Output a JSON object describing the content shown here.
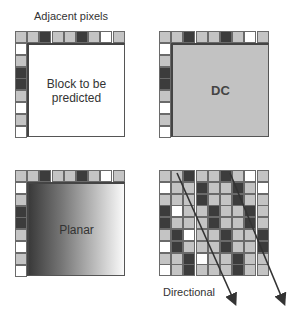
{
  "title": "Adjacent pixels",
  "panels": {
    "block": {
      "label": "Block to be predicted"
    },
    "dc": {
      "label": "DC"
    },
    "planar": {
      "label": "Planar"
    },
    "directional": {
      "label": "Directional"
    }
  },
  "adjacent_top_row": [
    "G",
    "G",
    "D",
    "G",
    "G",
    "D",
    "G",
    "W",
    "G"
  ],
  "adjacent_left_col": [
    "W",
    "G",
    "D",
    "D",
    "G",
    "W",
    "G",
    "W"
  ],
  "directional_grid": [
    [
      "G",
      "G",
      "D",
      "G",
      "G",
      "D",
      "G",
      "W",
      "G"
    ],
    [
      "W",
      "G",
      "G",
      "D",
      "G",
      "G",
      "D",
      "G",
      "W"
    ],
    [
      "G",
      "G",
      "G",
      "D",
      "G",
      "G",
      "D",
      "G",
      "G"
    ],
    [
      "D",
      "W",
      "G",
      "G",
      "D",
      "G",
      "G",
      "D",
      "G"
    ],
    [
      "D",
      "G",
      "G",
      "G",
      "D",
      "G",
      "G",
      "D",
      "G"
    ],
    [
      "G",
      "D",
      "W",
      "G",
      "G",
      "D",
      "G",
      "G",
      "D"
    ],
    [
      "W",
      "D",
      "G",
      "G",
      "G",
      "D",
      "G",
      "G",
      "D"
    ],
    [
      "G",
      "G",
      "D",
      "W",
      "G",
      "G",
      "D",
      "G",
      "G"
    ],
    [
      "W",
      "G",
      "D",
      "G",
      "G",
      "G",
      "D",
      "G",
      "G"
    ]
  ],
  "colors": {
    "G": "#c4c4c4",
    "D": "#3c3c3c",
    "W": "#ffffff"
  }
}
